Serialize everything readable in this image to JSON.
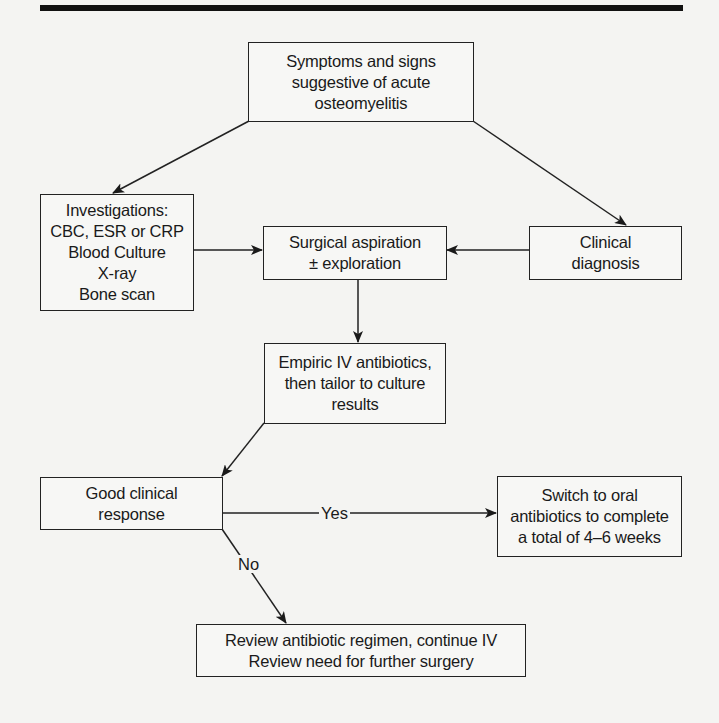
{
  "diagram": {
    "type": "flowchart",
    "colors": {
      "background": "#f4f4f2",
      "stroke": "#222222",
      "text": "#1a1a1a"
    },
    "nodes": {
      "symptoms": {
        "lines": [
          "Symptoms and signs",
          "suggestive of acute",
          "osteomyelitis"
        ]
      },
      "investigations": {
        "lines": [
          "Investigations:",
          "CBC, ESR or CRP",
          "Blood Culture",
          "X-ray",
          "Bone scan"
        ]
      },
      "surgical": {
        "lines": [
          "Surgical aspiration",
          "± exploration"
        ]
      },
      "clinical": {
        "lines": [
          "Clinical",
          "diagnosis"
        ]
      },
      "empiric": {
        "lines": [
          "Empiric IV antibiotics,",
          "then tailor to culture",
          "results"
        ]
      },
      "response": {
        "lines": [
          "Good clinical",
          "response"
        ]
      },
      "oral": {
        "lines": [
          "Switch to oral",
          "antibiotics to complete",
          "a total of 4–6 weeks"
        ]
      },
      "review": {
        "lines": [
          "Review antibiotic regimen, continue IV",
          "Review need for further surgery"
        ]
      }
    },
    "edges": [
      {
        "from": "symptoms",
        "to": "investigations",
        "label": ""
      },
      {
        "from": "symptoms",
        "to": "clinical",
        "label": ""
      },
      {
        "from": "investigations",
        "to": "surgical",
        "label": ""
      },
      {
        "from": "clinical",
        "to": "surgical",
        "label": ""
      },
      {
        "from": "surgical",
        "to": "empiric",
        "label": ""
      },
      {
        "from": "empiric",
        "to": "response",
        "label": ""
      },
      {
        "from": "response",
        "to": "oral",
        "label": "Yes"
      },
      {
        "from": "response",
        "to": "review",
        "label": "No"
      }
    ],
    "edge_labels": {
      "yes": "Yes",
      "no": "No"
    }
  }
}
